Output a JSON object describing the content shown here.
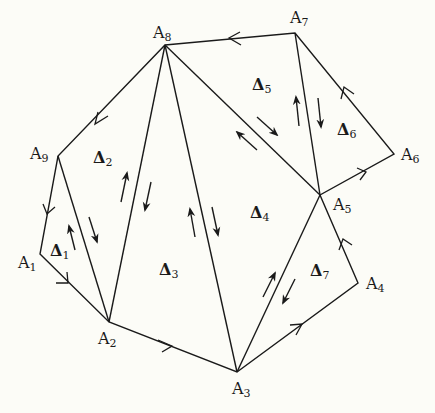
{
  "diagram": {
    "title": "",
    "stroke_color": "#1a1a1a",
    "background": "#fcfcf7",
    "vertices": [
      {
        "id": "A1",
        "label": "A",
        "sub": "1",
        "x": 40,
        "y": 254,
        "lx": 18,
        "ly": 255
      },
      {
        "id": "A2",
        "label": "A",
        "sub": "2",
        "x": 109,
        "y": 322,
        "lx": 98,
        "ly": 331
      },
      {
        "id": "A3",
        "label": "A",
        "sub": "3",
        "x": 237,
        "y": 372,
        "lx": 232,
        "ly": 381
      },
      {
        "id": "A4",
        "label": "A",
        "sub": "4",
        "x": 358,
        "y": 283,
        "lx": 366,
        "ly": 276
      },
      {
        "id": "A5",
        "label": "A",
        "sub": "5",
        "x": 320,
        "y": 195,
        "lx": 333,
        "ly": 197
      },
      {
        "id": "A6",
        "label": "A",
        "sub": "6",
        "x": 394,
        "y": 154,
        "lx": 401,
        "ly": 147
      },
      {
        "id": "A7",
        "label": "A",
        "sub": "7",
        "x": 295,
        "y": 33,
        "lx": 290,
        "ly": 10
      },
      {
        "id": "A8",
        "label": "A",
        "sub": "8",
        "x": 165,
        "y": 45,
        "lx": 153,
        "ly": 25
      },
      {
        "id": "A9",
        "label": "A",
        "sub": "9",
        "x": 58,
        "y": 156,
        "lx": 30,
        "ly": 146
      }
    ],
    "boundary_edges": [
      {
        "from": "A8",
        "to": "A7",
        "arrow_dir": "to-A8"
      },
      {
        "from": "A7",
        "to": "A6",
        "arrow_dir": "to-A7"
      },
      {
        "from": "A6",
        "to": "A5",
        "arrow_dir": "to-A6"
      },
      {
        "from": "A5",
        "to": "A4",
        "arrow_dir": "to-A5"
      },
      {
        "from": "A4",
        "to": "A3",
        "arrow_dir": "to-A4"
      },
      {
        "from": "A3",
        "to": "A2",
        "arrow_dir": "to-A3"
      },
      {
        "from": "A2",
        "to": "A1",
        "arrow_dir": "to-A2"
      },
      {
        "from": "A1",
        "to": "A9",
        "arrow_dir": "to-A1"
      },
      {
        "from": "A9",
        "to": "A8",
        "arrow_dir": "to-A9"
      }
    ],
    "interior_edges": [
      {
        "from": "A9",
        "to": "A2"
      },
      {
        "from": "A8",
        "to": "A2"
      },
      {
        "from": "A8",
        "to": "A3"
      },
      {
        "from": "A8",
        "to": "A5"
      },
      {
        "from": "A7",
        "to": "A5"
      },
      {
        "from": "A5",
        "to": "A3"
      }
    ],
    "triangles": [
      {
        "id": "Delta1",
        "label": "Δ",
        "sub": "1",
        "vertices": [
          "A1",
          "A2",
          "A9"
        ],
        "lx": 50,
        "ly": 243
      },
      {
        "id": "Delta2",
        "label": "Δ",
        "sub": "2",
        "vertices": [
          "A9",
          "A2",
          "A8"
        ],
        "lx": 93,
        "ly": 150
      },
      {
        "id": "Delta3",
        "label": "Δ",
        "sub": "3",
        "vertices": [
          "A2",
          "A3",
          "A8"
        ],
        "lx": 159,
        "ly": 262
      },
      {
        "id": "Delta4",
        "label": "Δ",
        "sub": "4",
        "vertices": [
          "A3",
          "A5",
          "A8"
        ],
        "lx": 250,
        "ly": 205
      },
      {
        "id": "Delta5",
        "label": "Δ",
        "sub": "5",
        "vertices": [
          "A5",
          "A7",
          "A8"
        ],
        "lx": 252,
        "ly": 77
      },
      {
        "id": "Delta6",
        "label": "Δ",
        "sub": "6",
        "vertices": [
          "A5",
          "A6",
          "A7"
        ],
        "lx": 337,
        "ly": 122
      },
      {
        "id": "Delta7",
        "label": "Δ",
        "sub": "7",
        "vertices": [
          "A3",
          "A4",
          "A5"
        ],
        "lx": 310,
        "ly": 263
      }
    ]
  }
}
